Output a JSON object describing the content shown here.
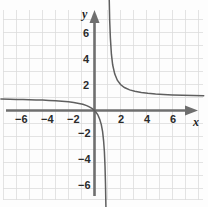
{
  "figure": {
    "axis_label_x": "x",
    "axis_label_y": "y",
    "colors": {
      "grid": "#d9d9d9",
      "axis": "#6b6b6b",
      "curve": "#5a5a5a",
      "label": "#2b2b2b",
      "background": "#fdfdfd"
    }
  },
  "chart_data": {
    "type": "line",
    "title": "",
    "xlabel": "x",
    "ylabel": "y",
    "grid": true,
    "legend": false,
    "xlim": [
      -7.2,
      8.5
    ],
    "ylim": [
      -7.5,
      7.5
    ],
    "xticks": [
      -6,
      -4,
      -2,
      2,
      4,
      6
    ],
    "yticks": [
      -6,
      -4,
      -2,
      2,
      4,
      6
    ],
    "xtick_labels": [
      "−6",
      "−4",
      "−2",
      "2",
      "4",
      "6"
    ],
    "ytick_labels": [
      "−6",
      "−4",
      "−2",
      "2",
      "4",
      "6"
    ],
    "tick_step": 1,
    "asymptotes": {
      "vertical_x": 1,
      "horizontal_y": 1
    },
    "series": [
      {
        "name": "left-branch",
        "x": [
          -7.2,
          -6.5,
          -6,
          -5.5,
          -5,
          -4.5,
          -4,
          -3.5,
          -3,
          -2.5,
          -2,
          -1.6,
          -1.2,
          -0.9,
          -0.6,
          -0.4,
          -0.2,
          -0.05,
          0.1,
          0.25,
          0.4,
          0.52,
          0.62,
          0.7,
          0.76,
          0.81,
          0.85,
          0.88,
          0.9
        ],
        "y": [
          0.878,
          0.867,
          0.857,
          0.846,
          0.833,
          0.818,
          0.8,
          0.778,
          0.75,
          0.714,
          0.667,
          0.615,
          0.545,
          0.474,
          0.375,
          0.286,
          0.167,
          0.048,
          -0.111,
          -0.333,
          -0.667,
          -1.083,
          -1.632,
          -2.333,
          -3.167,
          -4.263,
          -5.667,
          -7.333,
          -9.0
        ]
      },
      {
        "name": "right-branch",
        "x": [
          1.1,
          1.13,
          1.17,
          1.22,
          1.3,
          1.4,
          1.55,
          1.75,
          2,
          2.3,
          2.7,
          3.1,
          3.6,
          4.1,
          4.7,
          5.3,
          6,
          6.8,
          7.6,
          8.4
        ],
        "y": [
          11.0,
          8.69,
          6.88,
          5.55,
          4.33,
          3.5,
          2.82,
          2.33,
          2.0,
          1.769,
          1.588,
          1.476,
          1.385,
          1.323,
          1.27,
          1.233,
          1.2,
          1.172,
          1.152,
          1.135
        ]
      }
    ],
    "equation_hint": "y = x/(x-1)"
  },
  "artifacts": {
    "faint_top_text": ""
  }
}
